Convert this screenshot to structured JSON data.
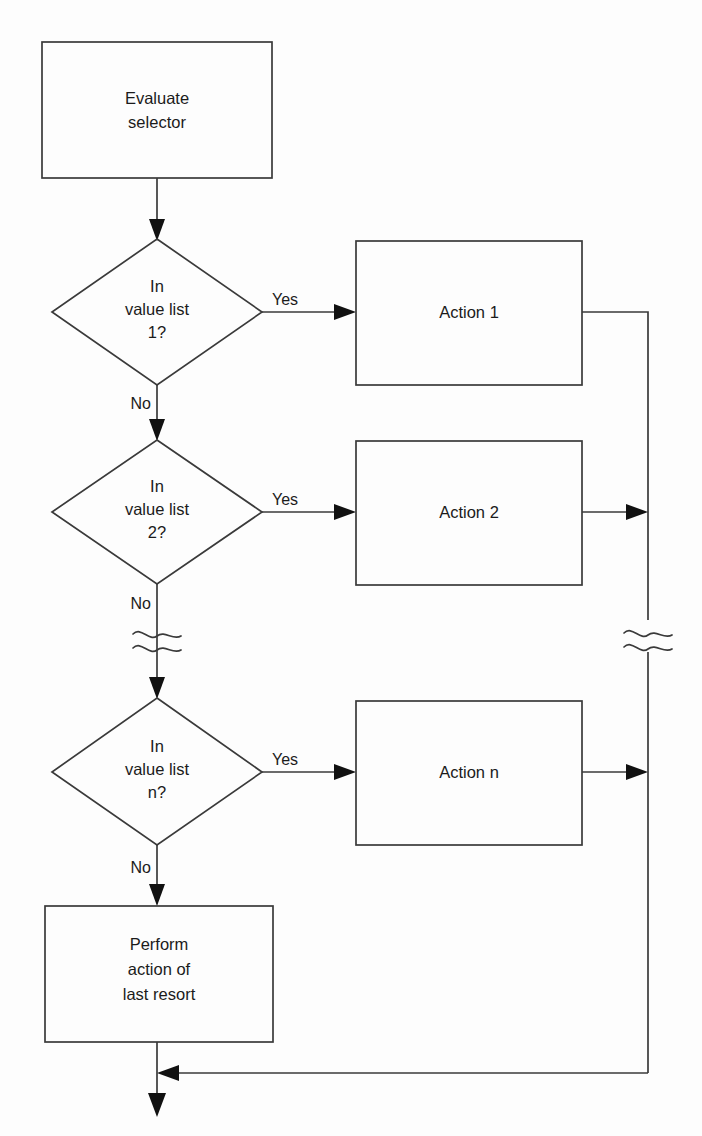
{
  "diagram": {
    "type": "flowchart",
    "background_color": "#fdfdfd",
    "line_color": "#3a3a3a",
    "text_color": "#1b1b1b"
  },
  "nodes": {
    "evaluate": {
      "shape": "process",
      "line1": "Evaluate",
      "line2": "selector"
    },
    "decision1": {
      "shape": "decision",
      "line1": "In",
      "line2": "value list",
      "line3": "1?"
    },
    "decision2": {
      "shape": "decision",
      "line1": "In",
      "line2": "value list",
      "line3": "2?"
    },
    "decision3": {
      "shape": "decision",
      "line1": "In",
      "line2": "value list",
      "line3": "n?"
    },
    "action1": {
      "shape": "process",
      "label": "Action 1"
    },
    "action2": {
      "shape": "process",
      "label": "Action 2"
    },
    "actionN": {
      "shape": "process",
      "label": "Action n"
    },
    "lastResort": {
      "shape": "process",
      "line1": "Perform",
      "line2": "action of",
      "line3": "last resort"
    }
  },
  "edge_labels": {
    "yes1": "Yes",
    "no1": "No",
    "yes2": "Yes",
    "no2": "No",
    "yes3": "Yes",
    "no3": "No"
  },
  "break_symbols": {
    "left_break": "ellipsis-break",
    "right_break": "ellipsis-break"
  }
}
